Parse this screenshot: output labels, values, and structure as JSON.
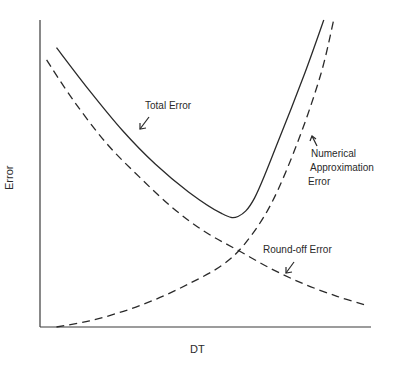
{
  "chart_data": {
    "type": "line",
    "title": "",
    "xlabel": "DT",
    "ylabel": "Error",
    "grid": false,
    "legend": "none (inline annotations with arrows)",
    "axis_ticks": "none",
    "units": "schematic / qualitative (normalized 0-1 axes)",
    "xlim": [
      0,
      1
    ],
    "ylim": [
      0,
      1
    ],
    "series": [
      {
        "name": "Total Error",
        "style": "solid",
        "x": [
          0.05,
          0.15,
          0.25,
          0.35,
          0.45,
          0.55,
          0.6,
          0.65,
          0.72,
          0.8,
          0.86
        ],
        "y": [
          0.91,
          0.77,
          0.64,
          0.53,
          0.44,
          0.37,
          0.36,
          0.42,
          0.6,
          0.82,
          1.0
        ]
      },
      {
        "name": "Round-off Error",
        "style": "dashed",
        "x": [
          0.02,
          0.1,
          0.2,
          0.3,
          0.4,
          0.5,
          0.6,
          0.7,
          0.8,
          0.9,
          0.99
        ],
        "y": [
          0.87,
          0.74,
          0.6,
          0.49,
          0.39,
          0.31,
          0.25,
          0.19,
          0.14,
          0.1,
          0.07
        ]
      },
      {
        "name": "Numerical Approximation Error",
        "style": "dashed",
        "x": [
          0.05,
          0.15,
          0.25,
          0.35,
          0.45,
          0.55,
          0.62,
          0.7,
          0.78,
          0.85,
          0.89
        ],
        "y": [
          0.0,
          0.02,
          0.05,
          0.09,
          0.14,
          0.2,
          0.27,
          0.4,
          0.6,
          0.82,
          1.0
        ]
      }
    ],
    "annotations": [
      {
        "text": "Total Error",
        "arrow_to": "Total Error curve"
      },
      {
        "text": "Numerical Approximation Error",
        "arrow_to": "Numerical Approximation Error curve"
      },
      {
        "text": "Round-off Error",
        "arrow_to": "Round-off Error curve"
      }
    ]
  },
  "labels": {
    "ylabel": "Error",
    "xlabel": "DT",
    "total": "Total Error",
    "numerical_1": "Numerical",
    "numerical_2": "Approximation",
    "numerical_3": "Error",
    "roundoff": "Round-off Error"
  },
  "plot_box": {
    "left": 40,
    "right": 370,
    "top": 20,
    "bottom": 327
  },
  "colors": {
    "ink": "#2a2a2a",
    "background": "#ffffff"
  }
}
